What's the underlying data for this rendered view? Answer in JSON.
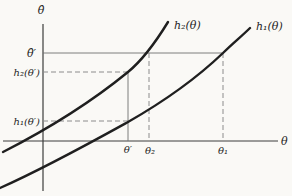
{
  "diagram": {
    "type": "function-sketch",
    "colors": {
      "background": "#faf9f6",
      "ink": "#1f1f1f",
      "axis": "#3c3c3c",
      "guide_solid": "#6f6f6f",
      "guide_dashed": "#8c8c8c"
    },
    "axes": {
      "y_label": "θ̂",
      "x_label": "θ"
    },
    "curves": {
      "h2_label": "h₂(θ)",
      "h1_label": "h₁(θ)"
    },
    "y_axis_labels": {
      "theta_hat_prime": "θ̂′",
      "h2_of_theta_prime": "h₂(θ′)",
      "h1_of_theta_prime": "h₁(θ′)"
    },
    "x_axis_labels": {
      "theta_prime": "θ′",
      "theta_2": "θ₂",
      "theta_1": "θ₁"
    }
  }
}
